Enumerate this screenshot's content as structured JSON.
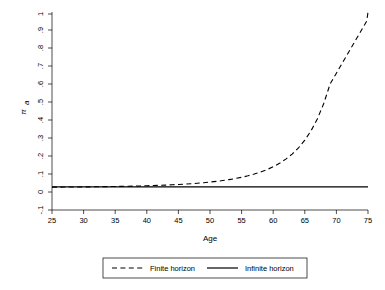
{
  "chart_data": {
    "type": "line",
    "title": "",
    "subtitle": "",
    "xlabel": "Age",
    "ylabel": "π",
    "ylabel_subscript": "a",
    "xlim": [
      25,
      75
    ],
    "ylim": [
      -0.1,
      1.0
    ],
    "grid": false,
    "legend_position": "bottom-outside",
    "xticks": [
      25,
      30,
      35,
      40,
      45,
      50,
      55,
      60,
      65,
      70,
      75
    ],
    "xtick_labels": [
      "25",
      "30",
      "35",
      "40",
      "45",
      "50",
      "55",
      "60",
      "65",
      "70",
      "75"
    ],
    "yticks": [
      -0.1,
      0,
      0.1,
      0.2,
      0.3,
      0.4,
      0.5,
      0.6,
      0.7,
      0.8,
      0.9,
      1.0
    ],
    "ytick_labels": [
      "-.1",
      "0",
      ".1",
      ".2",
      ".3",
      ".4",
      ".5",
      ".6",
      ".7",
      ".8",
      ".9",
      "1"
    ],
    "x": [
      25,
      26,
      27,
      28,
      29,
      30,
      31,
      32,
      33,
      34,
      35,
      36,
      37,
      38,
      39,
      40,
      41,
      42,
      43,
      44,
      45,
      46,
      47,
      48,
      49,
      50,
      51,
      52,
      53,
      54,
      55,
      56,
      57,
      58,
      59,
      60,
      61,
      62,
      63,
      64,
      65,
      66,
      67,
      68,
      69,
      70,
      71,
      72,
      73,
      73.5,
      74,
      74.3,
      74.6,
      74.8,
      75
    ],
    "series": [
      {
        "name": "Finite horizon",
        "style": "dashed",
        "color": "#000000",
        "values": [
          0.027,
          0.0272,
          0.0274,
          0.0277,
          0.028,
          0.0283,
          0.0287,
          0.0291,
          0.0296,
          0.0301,
          0.0307,
          0.0313,
          0.032,
          0.0328,
          0.0337,
          0.0347,
          0.0358,
          0.037,
          0.0384,
          0.04,
          0.0418,
          0.0438,
          0.0461,
          0.0487,
          0.0517,
          0.0551,
          0.059,
          0.0635,
          0.0687,
          0.0747,
          0.0817,
          0.0899,
          0.0995,
          0.1108,
          0.1242,
          0.1402,
          0.1594,
          0.1826,
          0.2108,
          0.2453,
          0.2879,
          0.3409,
          0.4075,
          0.4919,
          0.5999,
          0.6602,
          0.7205,
          0.7808,
          0.8411,
          0.871,
          0.9013,
          0.9195,
          0.9377,
          0.9498,
          1.0
        ]
      },
      {
        "name": "Infinite horizon",
        "style": "solid",
        "color": "#000000",
        "values": [
          0.0285,
          0.0285,
          0.0285,
          0.0285,
          0.0285,
          0.0285,
          0.0285,
          0.0285,
          0.0285,
          0.0285,
          0.0285,
          0.0285,
          0.0285,
          0.0285,
          0.0285,
          0.0285,
          0.0285,
          0.0285,
          0.0285,
          0.0285,
          0.0285,
          0.0285,
          0.0285,
          0.0285,
          0.0285,
          0.0285,
          0.0285,
          0.0285,
          0.0285,
          0.0285,
          0.0285,
          0.0285,
          0.0285,
          0.0285,
          0.0285,
          0.0285,
          0.0285,
          0.0285,
          0.0285,
          0.0285,
          0.0285,
          0.0285,
          0.0285,
          0.0285,
          0.0285,
          0.0285,
          0.0285,
          0.0285,
          0.0285,
          0.0285,
          0.0285,
          0.0285,
          0.0285,
          0.0285,
          0.0285
        ]
      }
    ],
    "annotations": []
  },
  "legend": {
    "entries": [
      {
        "label": "Finite horizon",
        "style": "dashed"
      },
      {
        "label": "Infinite horizon",
        "style": "solid"
      }
    ]
  },
  "axes": {
    "x_title": "Age",
    "y_title": "π"
  }
}
